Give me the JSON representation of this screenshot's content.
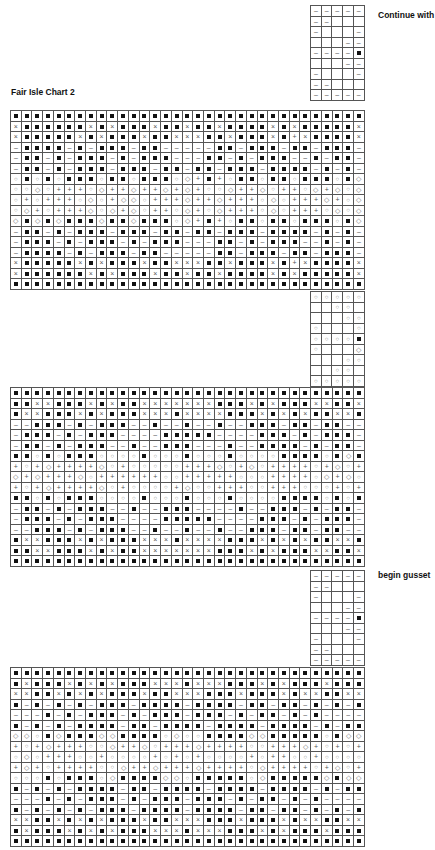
{
  "labels": {
    "continue": "Continue with",
    "chart_title": "Fair Isle Chart 2",
    "gusset": "begin gusset"
  },
  "legend_symbols": {
    "B": "filled-square",
    "x": "cross",
    "m": "dash",
    "o": "circle",
    "d": "diamond",
    "p": "plus",
    "_": "empty"
  },
  "strip_top": [
    "mmmmm",
    "mm___",
    "m___m",
    "___mm",
    "mmmmB",
    "___mm",
    "m___m",
    "mm___",
    "mmmmm"
  ],
  "block1": [
    "BBBBBBBBBBBBBBBBBBBBBBBBBBBBBBBBB",
    "xBBBBBBxBxBBBxBBxBBxBBBBxBxBBBBBx",
    "xBBBBBxBxBBBxBBxxxBBxBBBxBpxBBBBx",
    "mBBBBmBmBBBmBBmmmmmBBmBBBmBBmBBBm",
    "mBBmBmBBBmBmBBBmmmBBmBmBBBmmBmBBm",
    "mBBmBmBBBmBBBmBBmBBmBBBmBBBBmBmBm",
    "oBoBoBBBoBBoBBBodpBpoBBoBBoBBBoBd",
    "oodopppodppdppdpdpoodppdoppodpdod",
    "opopppodopddopppdppdpppodopppdpod",
    "odpopppdodpdoppodpodpppodopppodod",
    "dBdBdBBBdBBdBBBodpBpoBBoBBoBBBoBd",
    "mBBmBmBBBmBBBmBBmBBmBBBmBBBBmBmBm",
    "mBBBmBmBBBmBmBBBmmmBBmBmBBBmmBmBm",
    "mBBBBmBmBBBmBBmmmmmBBmBBBmBBmBBBm",
    "xBBBBBxBxBBBxBBxxxBBxBBBxBpxBBBBx",
    "xBBBBBBxBxBBBxBBxBBxBBBBxBxBBBBBx",
    "BBBBBBBBBBBBBBBBBBBBBBBBBBBBBBBBB"
  ],
  "strip_mid": [
    "ooooo",
    "__oo_",
    "___oo",
    "o___o",
    "ooooB",
    "o___d",
    "___oo",
    "__oo_",
    "ooooo"
  ],
  "block2": [
    "BBBBBBBBBBBBBBBBBBBBBBBBBBBBBBBBB",
    "BBxxBBBxBxBBxxxxxxxBBBxBxBBBxxBBx",
    "BxxBBBxBxBBBxxxBxxxxBBBxBxBxBBxxB",
    "mmBBBmBmBBBmmBmmBmmBmmBBBmBBmBBmm",
    "mBBBmBmBBBmmmmBBBBBmmmmBBBmBmBBBm",
    "mBBmBmBBBmmBmmBBBmmmBmmBBBBmBmBBm",
    "BBoBoBBBooooBoooBoooBooooBBBBoBdB",
    "popdppppdopooooopppdopdoppppopdop",
    "dpdpppdoppppppoopppppoooppppodpdo",
    "popdppppdopoooopdoopppoopppooopop",
    "BBoBoBBBooooBoooBoooBooooBBBBoBoB",
    "mBBmBmBBBmmBmmBBBmmmmBmmBBBmBmBBm",
    "mBBBmBmBBBmmmmBBBBBmmmmBBBmBmBBBm",
    "mmBBBmBmBBBmmBmmBmmBmmBBBmBBmBBmm",
    "BxxBBBxBxBBBxxxBxxxxBBBxBxBxBBxxB",
    "BBxxBBBxBxBBxxxxxxxBBBxBxBBBxxBBx",
    "BBBBBBBBBBBBBBBBBBBBBBBBBBBBBBBBB"
  ],
  "strip_bot": [
    "mmmmm",
    "mm___",
    "m___m",
    "___mm",
    "mmmmB",
    "___mm",
    "m___m",
    "mm___",
    "mmmmm"
  ],
  "block3": [
    "BBBBBBBBBBBBBBBBBBBBBBBBBBBBBBBBB",
    "BxBBBxBxBxBBBxxxBxxxBBBxBxBBBxBBB",
    "xxBBxBxBxBBBxBBxxxBBBxBBBxBxxBBxx",
    "BmBmBmBmBBBmBBBBmBBBBmBBmBBmBmBmB",
    "mmmBmBmBBBmBmBBBmBBBmBmBBmBmBmmmm",
    "BmBmBmBBBBmBBmBBBBmBBBBmBBBBmBmBB",
    "ddoBdBBBddBBBBodooBBBBddBBBBBoBdd",
    "popdpppoodppdopppdppppoopppdpopop",
    "odopppoopoooopopopoooopoppoopoooo",
    "pdpoppppoodppdpppdppppodppppopdop",
    "oooBoBBBodBBBBddoBBBBBodBBBBBdBdd",
    "BmBmBmBBBBmBBmBBBBmBBBBmBBBBmBmBB",
    "mmmBmBmBBBmBmBBBmBBBmBmBBmBmBmmmm",
    "BmBmBmBmBBBmBBBBmBBBBmBBmBBmBmBmB",
    "xxBBxBxBxBBBxBBxxxBBBxBBBxBxxBBxx",
    "BxBBBxBxBxBBBxxxBxxxBBBxBxBBBxBBB",
    "BBBBBBBBBBBBBBBBBBBBBBBBBBBBBBBBB"
  ]
}
